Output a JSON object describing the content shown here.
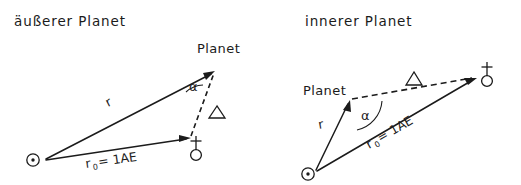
{
  "figure": {
    "width": 521,
    "height": 185,
    "background": "#ffffff",
    "ink_color": "#1b1b1b"
  },
  "panels": [
    {
      "id": "outer-planet",
      "title": "äußerer Planet",
      "labels": {
        "planet": "Planet",
        "r": "r",
        "r0": "r",
        "r0_sub": "0",
        "r0_eq": "= 1AE",
        "alpha": "α",
        "delta": "△"
      },
      "symbols": {
        "sun": "sun-symbol",
        "earth": "earth-symbol"
      },
      "geometry": {
        "sun": [
          42,
          160
        ],
        "earth": [
          192,
          137
        ],
        "planet": [
          216,
          71
        ]
      }
    },
    {
      "id": "inner-planet",
      "title": "innerer Planet",
      "labels": {
        "planet": "Planet",
        "r": "r",
        "r0": "r",
        "r0_sub": "0",
        "r0_eq": "= 1AE",
        "alpha": "α",
        "delta": "△"
      },
      "symbols": {
        "sun": "sun-symbol",
        "earth": "earth-symbol"
      },
      "geometry": {
        "sun": [
          313,
          172
        ],
        "planet": [
          350,
          100
        ],
        "earth": [
          478,
          78
        ]
      }
    }
  ]
}
